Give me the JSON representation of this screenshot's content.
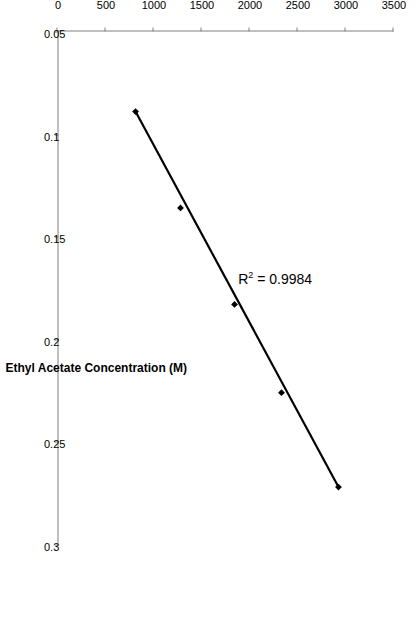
{
  "figure": {
    "background_color": "#ffffff",
    "rotation_degrees": 90,
    "axis_color": "#808080",
    "series_color": "#000000"
  },
  "annotation": {
    "r2_prefix": "R",
    "r2_superscript": "2",
    "r2_value": " = 0.9984"
  },
  "chart_data": {
    "type": "scatter",
    "title": "",
    "xlabel": "Ethyl Acetate Concentration (M)",
    "ylabel": "Raman Intensity (Arb. u.)",
    "xlim": [
      0.05,
      0.3
    ],
    "ylim": [
      0,
      3500
    ],
    "xticks": [
      0.05,
      0.1,
      0.15,
      0.2,
      0.25,
      0.3
    ],
    "xticklabels": [
      "0.05",
      "0.1",
      "0.15",
      "0.2",
      "0.25",
      "0.3"
    ],
    "yticks": [
      0,
      500,
      1000,
      1500,
      2000,
      2500,
      3000,
      3500
    ],
    "yticklabels": [
      "0",
      "500",
      "1000",
      "1500",
      "2000",
      "2500",
      "3000",
      "3500"
    ],
    "grid": false,
    "legend": false,
    "marker": "diamond",
    "trendline": true,
    "r_squared": 0.9984,
    "x": [
      0.089,
      0.136,
      0.183,
      0.226,
      0.272
    ],
    "y": [
      813,
      1281,
      1844,
      2333,
      2927
    ],
    "series": [
      {
        "name": "Ethyl acetate calibration",
        "points": [
          {
            "x": 0.089,
            "y": 813
          },
          {
            "x": 0.136,
            "y": 1281
          },
          {
            "x": 0.183,
            "y": 1844
          },
          {
            "x": 0.226,
            "y": 2333
          },
          {
            "x": 0.272,
            "y": 2927
          }
        ]
      }
    ]
  }
}
